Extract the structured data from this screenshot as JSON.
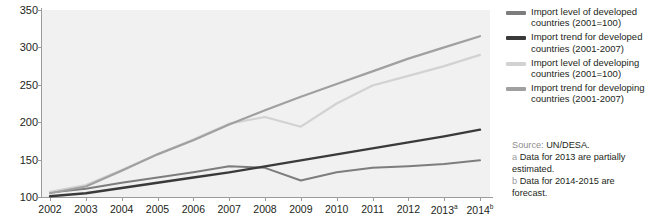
{
  "chart_data": {
    "type": "line",
    "title": "",
    "xlabel": "",
    "ylabel": "",
    "ylim": [
      100,
      350
    ],
    "yticks": [
      100,
      150,
      200,
      250,
      300,
      350
    ],
    "grid": false,
    "legend_position": "right",
    "x": [
      "2002",
      "2003",
      "2004",
      "2005",
      "2006",
      "2007",
      "2008",
      "2009",
      "2010",
      "2011",
      "2012",
      "2013",
      "2014"
    ],
    "x_tick_labels": [
      "2002",
      "2003",
      "2004",
      "2005",
      "2006",
      "2007",
      "2008",
      "2009",
      "2010",
      "2011",
      "2012",
      "2013a",
      "2014b"
    ],
    "x_superscripts": {
      "2013": "a",
      "2014": "b"
    },
    "series": [
      {
        "name": "Import level of developed countries (2001=100)",
        "key": "developed_level",
        "color": "#7d7d7d",
        "width": 2.0,
        "values": [
          106,
          111,
          119,
          126,
          133,
          141,
          139,
          122,
          133,
          139,
          141,
          144,
          149
        ]
      },
      {
        "name": "Import trend for developed countries (2001-2007)",
        "key": "developed_trend",
        "color": "#3a3a3a",
        "width": 2.4,
        "values": [
          101,
          105,
          112,
          119,
          126,
          133,
          141,
          149,
          157,
          165,
          173,
          181,
          190
        ]
      },
      {
        "name": "Import level of developing countries (2001=100)",
        "key": "developing_level",
        "color": "#d2d2d2",
        "width": 2.2,
        "values": [
          107,
          116,
          136,
          157,
          177,
          198,
          207,
          194,
          225,
          249,
          262,
          275,
          290
        ]
      },
      {
        "name": "Import trend for developing countries (2001-2007)",
        "key": "developing_trend",
        "color": "#a0a0a0",
        "width": 2.2,
        "values": [
          105,
          114,
          135,
          157,
          176,
          197,
          216,
          234,
          251,
          268,
          285,
          300,
          315
        ]
      }
    ]
  },
  "legend": {
    "items": [
      {
        "label": "Import level of developed countries (2001=100)",
        "color": "#7d7d7d"
      },
      {
        "label": "Import trend for developed countries (2001-2007)",
        "color": "#3a3a3a"
      },
      {
        "label": "Import level of developing countries (2001=100)",
        "color": "#d2d2d2"
      },
      {
        "label": "Import trend for developing countries (2001-2007)",
        "color": "#a0a0a0"
      }
    ]
  },
  "notes": {
    "source_label": "Source:",
    "source_value": "UN/DESA.",
    "footnote_a_mark": "a",
    "footnote_a_text": "Data for 2013 are partially estimated.",
    "footnote_b_mark": "b",
    "footnote_b_text": "Data for 2014-2015 are forecast."
  }
}
